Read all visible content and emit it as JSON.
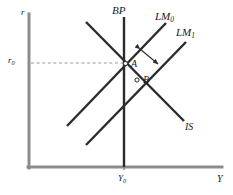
{
  "figure": {
    "kind": "is-lm-bp-diagram",
    "background_color": "#ffffff",
    "axis_color": "#8c8c8c",
    "curve_color": "#2b2b2b",
    "dashed_color": "#9a9a9a"
  },
  "axes": {
    "y_axis_label": "r",
    "x_axis_label": "Y",
    "y_tick_label": "r",
    "y_tick_sub": "0",
    "x_tick_label": "Y",
    "x_tick_sub": "0"
  },
  "curves": {
    "bp": {
      "label": "BP",
      "sub": ""
    },
    "lm0": {
      "label": "LM",
      "sub": "0"
    },
    "lm1": {
      "label": "LM",
      "sub": "1"
    },
    "is": {
      "label": "IS",
      "sub": ""
    }
  },
  "points": {
    "a": {
      "label": "A"
    },
    "b": {
      "label": "B"
    }
  },
  "annotations": {
    "shift_arrow": "double-headed-arrow"
  }
}
